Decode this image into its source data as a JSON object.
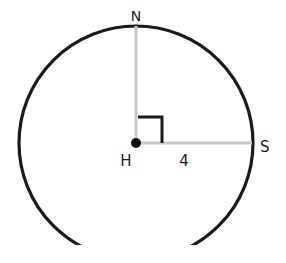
{
  "diagram": {
    "type": "circle-with-radii",
    "center": {
      "label": "H"
    },
    "points": [
      {
        "label": "N",
        "position": "top"
      },
      {
        "label": "S",
        "position": "right"
      }
    ],
    "segments": [
      {
        "from": "H",
        "to": "S",
        "length_label": "4"
      },
      {
        "from": "H",
        "to": "N",
        "length_label": ""
      }
    ],
    "right_angle_at": "H",
    "colors": {
      "circle": "#1a1a1a",
      "radius": "#c8c8c8",
      "right_angle_mark": "#1a1a1a",
      "text": "#1a1a1a"
    }
  }
}
